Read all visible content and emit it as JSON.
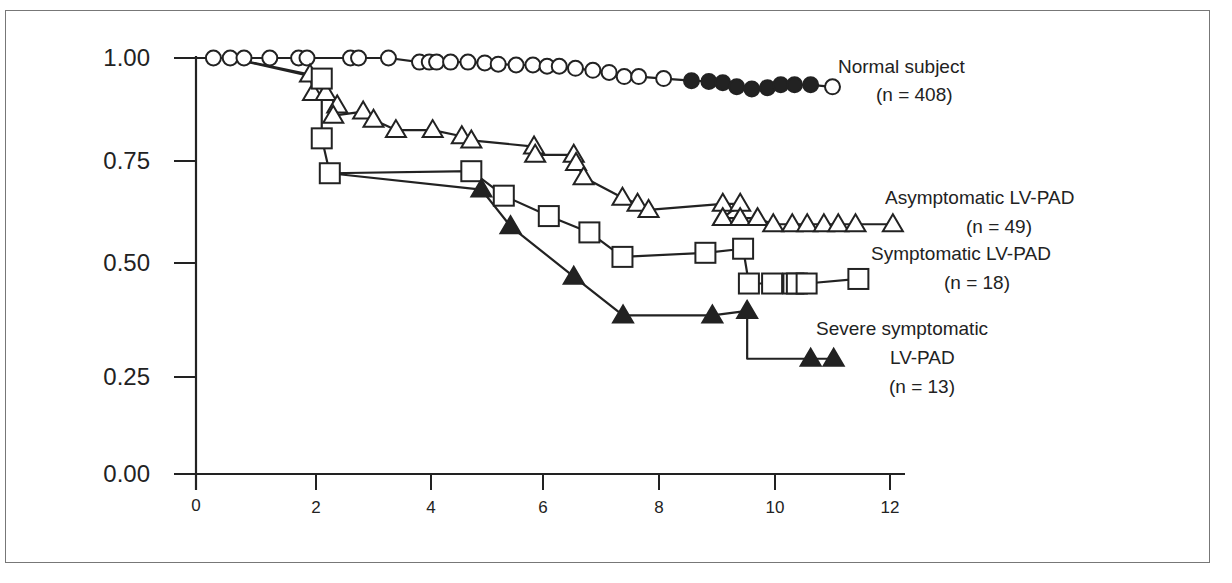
{
  "chart_data": {
    "type": "line",
    "subtype": "kaplan-meier survival curves",
    "title": "",
    "xlabel": "",
    "ylabel": "",
    "xlim": [
      0,
      12
    ],
    "ylim": [
      0,
      1
    ],
    "x_ticks": [
      "0",
      "2",
      "4",
      "6",
      "8",
      "10",
      "12"
    ],
    "y_ticks": [
      "1.00",
      "0.75",
      "0.50",
      "0.25",
      "0.00"
    ],
    "grid": false,
    "legend": "inline labels at right of each curve",
    "series": [
      {
        "name": "Normal subject",
        "n_label": "(n = 408)",
        "marker": "open-circle",
        "x": [
          0.29,
          0.57,
          0.8,
          1.23,
          1.71,
          1.85,
          2.6,
          2.74,
          3.26,
          3.8,
          3.97,
          4.1,
          4.35,
          4.66,
          4.96,
          5.2,
          5.52,
          5.82,
          6.07,
          6.28,
          6.56,
          6.86,
          7.14,
          7.4,
          7.65,
          8.08,
          8.56,
          8.86,
          9.1,
          9.34,
          9.6,
          9.87,
          10.1,
          10.34,
          10.62,
          11.0
        ],
        "y": [
          1.0,
          1.0,
          1.0,
          1.0,
          1.0,
          1.0,
          1.0,
          1.0,
          1.0,
          0.99,
          0.99,
          0.99,
          0.99,
          0.99,
          0.988,
          0.985,
          0.983,
          0.983,
          0.98,
          0.98,
          0.975,
          0.97,
          0.965,
          0.955,
          0.955,
          0.95,
          0.945,
          0.943,
          0.94,
          0.93,
          0.925,
          0.928,
          0.935,
          0.935,
          0.935,
          0.93
        ],
        "filled_from_index": 26,
        "filled_to_index": 34
      },
      {
        "name": "Asymptomatic LV-PAD",
        "n_label": "(n = 49)",
        "marker": "open-triangle",
        "x": [
          1.9,
          1.95,
          2.17,
          2.37,
          2.3,
          2.82,
          3.0,
          3.39,
          4.03,
          4.55,
          4.72,
          5.84,
          5.86,
          6.53,
          6.57,
          6.7,
          7.37,
          7.63,
          7.82,
          9.1,
          9.4,
          9.1,
          9.4,
          9.7,
          9.97,
          10.3,
          10.56,
          10.85,
          11.1,
          11.4,
          12.05
        ],
        "y": [
          0.96,
          0.915,
          0.915,
          0.885,
          0.86,
          0.87,
          0.85,
          0.825,
          0.825,
          0.81,
          0.8,
          0.785,
          0.765,
          0.765,
          0.745,
          0.71,
          0.66,
          0.645,
          0.63,
          0.645,
          0.645,
          0.61,
          0.61,
          0.61,
          0.595,
          0.595,
          0.595,
          0.595,
          0.595,
          0.595,
          0.595
        ]
      },
      {
        "name": "Symptomatic LV-PAD",
        "n_label": "(n = 18)",
        "marker": "open-square",
        "x": [
          2.1,
          2.1,
          2.24,
          4.72,
          5.3,
          6.1,
          6.8,
          7.37,
          8.8,
          9.45,
          9.55,
          9.95,
          10.32,
          10.38,
          10.55,
          11.45
        ],
        "y": [
          0.95,
          0.805,
          0.72,
          0.725,
          0.665,
          0.615,
          0.575,
          0.515,
          0.525,
          0.535,
          0.455,
          0.455,
          0.455,
          0.455,
          0.455,
          0.465
        ]
      },
      {
        "name": "Severe symptomatic LV-PAD",
        "n_label": "(n = 13)",
        "marker": "filled-triangle",
        "x": [
          4.9,
          5.42,
          6.53,
          7.38,
          8.92,
          9.52,
          10.62,
          11.02
        ],
        "y": [
          0.68,
          0.59,
          0.47,
          0.385,
          0.385,
          0.395,
          0.29,
          0.29
        ]
      }
    ]
  },
  "labels": {
    "normal": {
      "name": "Normal subject",
      "n": "(n = 408)"
    },
    "asymptomatic": {
      "name": "Asymptomatic LV-PAD",
      "n": "(n = 49)"
    },
    "symptomatic": {
      "name": "Symptomatic LV-PAD",
      "n": "(n = 18)"
    },
    "severe": {
      "name1": "Severe symptomatic",
      "name2": "LV-PAD",
      "n": "(n = 13)"
    }
  },
  "colors": {
    "ink": "#222222",
    "frame": "#777777",
    "background": "#ffffff"
  }
}
